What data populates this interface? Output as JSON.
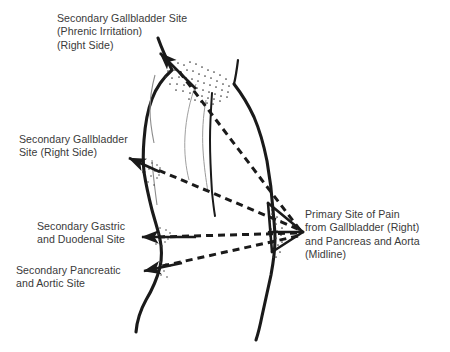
{
  "figure": {
    "view": "right lateral view of human torso",
    "background_color": "#ffffff",
    "ink_color": "#1a1a1a",
    "text_color": "#3a3a3a",
    "stipple_color": "#4a4a4a"
  },
  "labels": {
    "phrenic": {
      "line1": "Secondary Gallbladder Site",
      "line2": "(Phrenic Irritation)",
      "line3": "(Right Side)"
    },
    "gallbladder_right": {
      "line1": "Secondary Gallbladder",
      "line2": "Site (Right Side)"
    },
    "gastric_duodenal": {
      "line1": "Secondary Gastric",
      "line2": "and Duodenal Site"
    },
    "pancreatic_aortic": {
      "line1": "Secondary Pancreatic",
      "line2": "and Aortic Site"
    },
    "primary_site": {
      "line1": "Primary Site of Pain",
      "line2": "from Gallbladder (Right)",
      "line3": "and Pancreas and Aorta",
      "line4": "(Midline)"
    }
  },
  "annotations": {
    "primary_point": {
      "x": 303,
      "y": 232
    },
    "arrows": [
      {
        "name": "phrenic-arrow",
        "from_x": 196,
        "from_y": 89,
        "to_x": 157,
        "to_y": 50
      },
      {
        "name": "gallbladder-arrow",
        "from_x": 160,
        "from_y": 172,
        "to_x": 126,
        "to_y": 157
      },
      {
        "name": "gastric-arrow",
        "from_x": 196,
        "from_y": 237,
        "to_x": 139,
        "to_y": 237
      },
      {
        "name": "pancreatic-arrow",
        "from_x": 182,
        "from_y": 263,
        "to_x": 141,
        "to_y": 272
      }
    ],
    "referral_lines": [
      {
        "name": "phrenic-referral",
        "style": "dashed",
        "from_x": 303,
        "from_y": 232,
        "to_x": 178,
        "to_y": 70
      },
      {
        "name": "gallbladder-referral",
        "style": "dashed",
        "from_x": 303,
        "from_y": 232,
        "to_x": 158,
        "to_y": 170
      },
      {
        "name": "gastric-referral",
        "style": "dashed",
        "from_x": 303,
        "from_y": 232,
        "to_x": 160,
        "to_y": 237
      },
      {
        "name": "pancreatic-referral",
        "style": "dashed",
        "from_x": 303,
        "from_y": 232,
        "to_x": 160,
        "to_y": 267
      }
    ]
  }
}
